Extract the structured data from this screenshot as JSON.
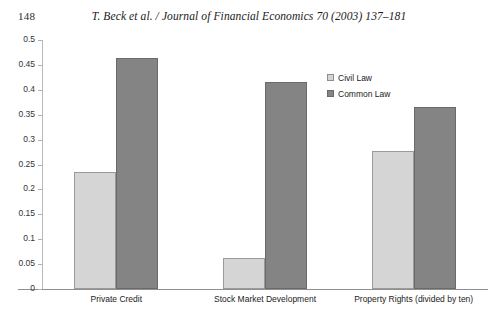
{
  "running_head": {
    "page_number": "148",
    "journal_reference": "T. Beck et al. / Journal of Financial Economics 70 (2003) 137–181"
  },
  "chart_data": {
    "type": "bar",
    "title": "",
    "xlabel": "",
    "ylabel": "",
    "ylim": [
      0,
      0.5
    ],
    "grid": false,
    "legend_position": "top-right",
    "categories": [
      "Private Credit",
      "Stock Market Development",
      "Property Rights (divided by ten)"
    ],
    "series": [
      {
        "name": "Civil Law",
        "color": "#d5d5d5",
        "values": [
          0.235,
          0.063,
          0.277
        ]
      },
      {
        "name": "Common Law",
        "color": "#848484",
        "values": [
          0.464,
          0.416,
          0.366
        ]
      }
    ],
    "ytick_labels": [
      "0",
      "0.05",
      "0.1",
      "0.15",
      "0.2",
      "0.25",
      "0.3",
      "0.35",
      "0.4",
      "0.45",
      "0.5"
    ],
    "ytick_values": [
      0,
      0.05,
      0.1,
      0.15,
      0.2,
      0.25,
      0.3,
      0.35,
      0.4,
      0.45,
      0.5
    ]
  }
}
